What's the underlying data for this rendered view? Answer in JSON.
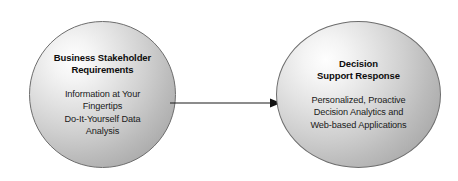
{
  "diagram": {
    "type": "two-node-flow",
    "background_color": "#ffffff",
    "nodes": [
      {
        "id": "business-stakeholder-requirements",
        "shape": "circle",
        "title": "Business Stakeholder\nRequirements",
        "body": "Information at Your\nFingertips\nDo-It-Yourself Data\nAnalysis",
        "fill_light": "#fefefe",
        "fill_dark": "#a2a2a2",
        "border_color": "#6d6d6d",
        "text_color": "#0d0d0d"
      },
      {
        "id": "decision-support-response",
        "shape": "circle",
        "title": "Decision\nSupport Response",
        "body": "Personalized, Proactive\nDecision Analytics and\nWeb-based Applications",
        "fill_light": "#fefefe",
        "fill_dark": "#a2a2a2",
        "border_color": "#6d6d6d",
        "text_color": "#0d0d0d"
      }
    ],
    "connector": {
      "id": "left-to-right-arrow",
      "style": "single-headed-arrow",
      "direction": "left-to-right",
      "color": "#1a1a1a",
      "from": "business-stakeholder-requirements",
      "to": "decision-support-response"
    }
  }
}
